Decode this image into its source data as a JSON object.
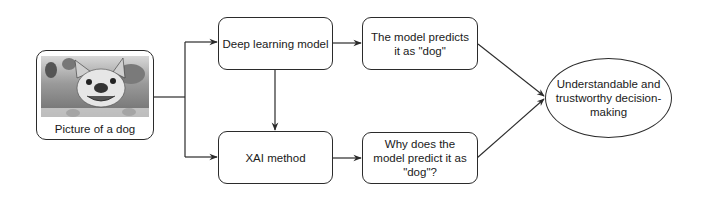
{
  "diagram": {
    "nodes": {
      "input": {
        "label": "Picture of a dog",
        "image": "dog-photo"
      },
      "deep_learning": {
        "label": "Deep learning model"
      },
      "prediction": {
        "label": "The model predicts it as \"dog\""
      },
      "xai": {
        "label": "XAI method"
      },
      "explanation": {
        "label": "Why does the model predict it as \"dog\"?"
      },
      "outcome": {
        "label": "Understandable and trustworthy decision-making"
      }
    },
    "edges": [
      {
        "from": "input",
        "to": "deep_learning"
      },
      {
        "from": "input",
        "to": "xai"
      },
      {
        "from": "deep_learning",
        "to": "prediction"
      },
      {
        "from": "deep_learning",
        "to": "xai"
      },
      {
        "from": "xai",
        "to": "explanation"
      },
      {
        "from": "prediction",
        "to": "outcome"
      },
      {
        "from": "explanation",
        "to": "outcome"
      }
    ],
    "colors": {
      "stroke": "#2b2b2b",
      "background": "#ffffff",
      "text": "#1a1a1a"
    }
  }
}
